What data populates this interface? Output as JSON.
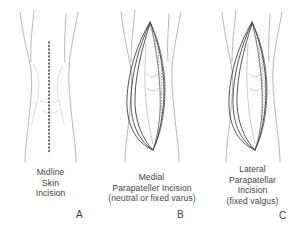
{
  "figure": {
    "background_color": "#ffffff",
    "ink_color": "#3f3f3f",
    "skin_outline_color": "#9a9a9a",
    "incision_line_color": "#2e2e2e",
    "tissue_shading_color": "#555555",
    "panel_count": 3
  },
  "panels": [
    {
      "letter": "A",
      "caption_lines": [
        "Midline",
        "Skin",
        "Incision"
      ],
      "depicts": "knee-with-dotted-midline-incision-marking",
      "incision_style": "dotted-vertical-line",
      "wound_open": false
    },
    {
      "letter": "B",
      "caption_lines": [
        "Medial",
        "Parapateller Incision",
        "(neutral or fixed varus)"
      ],
      "depicts": "knee-with-open-medial-parapatellar-arthrotomy",
      "incision_style": "open-lens-shaped-wound",
      "wound_open": true,
      "shaded_edge": "medial"
    },
    {
      "letter": "C",
      "caption_lines": [
        "Lateral",
        "Parapatellar",
        "Incision",
        "(fixed valgus)"
      ],
      "depicts": "knee-with-open-lateral-parapatellar-arthrotomy",
      "incision_style": "open-lens-shaped-wound",
      "wound_open": true,
      "shaded_edge": "lateral"
    }
  ]
}
